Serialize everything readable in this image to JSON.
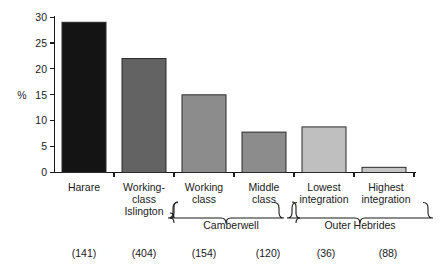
{
  "chart_data": {
    "type": "bar",
    "title": "",
    "subtitle": "",
    "xlabel": "",
    "ylabel": "%",
    "ylim": [
      0,
      30
    ],
    "ytick_labels": [
      "0",
      "5",
      "10",
      "15",
      "20",
      "25",
      "30"
    ],
    "ytick_values": [
      0,
      5,
      10,
      15,
      20,
      25,
      30
    ],
    "grid": false,
    "legend": "none",
    "categories": [
      "Harare",
      "Working-class Islington",
      "Working class",
      "Middle class",
      "Lowest integration",
      "Highest integration"
    ],
    "category_label_lines": [
      [
        "Harare"
      ],
      [
        "Working-",
        "class",
        "Islington"
      ],
      [
        "Working",
        "class"
      ],
      [
        "Middle",
        "class"
      ],
      [
        "Lowest",
        "integration"
      ],
      [
        "Highest",
        "integration"
      ]
    ],
    "values": [
      29,
      22,
      15,
      7.8,
      8.8,
      1
    ],
    "bar_colors": [
      "#141414",
      "#636363",
      "#8c8c8c",
      "#8c8c8c",
      "#bfbfbf",
      "#c4c4c4"
    ],
    "sample_sizes": [
      "(141)",
      "(404)",
      "(154)",
      "(120)",
      "(36)",
      "(88)"
    ],
    "groups": [
      {
        "label": "Camberwell",
        "first_index": 2,
        "last_index": 3
      },
      {
        "label": "Outer Hebrides",
        "first_index": 4,
        "last_index": 5
      }
    ]
  },
  "axis": {
    "y_label": "%",
    "y_ticks": [
      "30",
      "25",
      "20",
      "15",
      "10",
      "5",
      "0"
    ]
  },
  "categories": {
    "c0_l0": "Harare",
    "c1_l0": "Working-",
    "c1_l1": "class",
    "c1_l2": "Islington",
    "c2_l0": "Working",
    "c2_l1": "class",
    "c3_l0": "Middle",
    "c3_l1": "class",
    "c4_l0": "Lowest",
    "c4_l1": "integration",
    "c5_l0": "Highest",
    "c5_l1": "integration"
  },
  "groups": {
    "g0": "Camberwell",
    "g1": "Outer Hebrides"
  },
  "counts": {
    "n0": "(141)",
    "n1": "(404)",
    "n2": "(154)",
    "n3": "(120)",
    "n4": "(36)",
    "n5": "(88)"
  }
}
